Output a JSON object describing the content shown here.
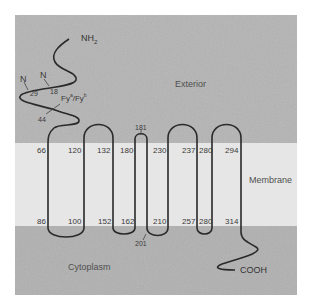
{
  "diagram": {
    "regions": {
      "exterior": "Exterior",
      "membrane": "Membrane",
      "cytoplasm": "Cytoplasm"
    },
    "termini": {
      "n_terminus": "NH",
      "n_terminus_sub": "2",
      "c_terminus": "COOH"
    },
    "glycosylation_sites": [
      {
        "label": "N",
        "residue": "29"
      },
      {
        "label": "N",
        "residue": "18"
      }
    ],
    "antigen": {
      "label": "Fy",
      "sup_a": "a",
      "sep": "/Fy",
      "sup_b": "b",
      "residue": "44"
    },
    "residue_labels": {
      "top": [
        "66",
        "120",
        "132",
        "180",
        "230",
        "237",
        "280",
        "294"
      ],
      "bottom": [
        "86",
        "100",
        "152",
        "162",
        "210",
        "257",
        "280",
        "314"
      ],
      "loop_top": "181",
      "loop_bottom": "201"
    },
    "colors": {
      "exterior_bg": "#b4b4b4",
      "membrane_bg": "#e6e6e6",
      "cytoplasm_bg": "#b0b0b0",
      "line": "#2a2a2a"
    }
  }
}
